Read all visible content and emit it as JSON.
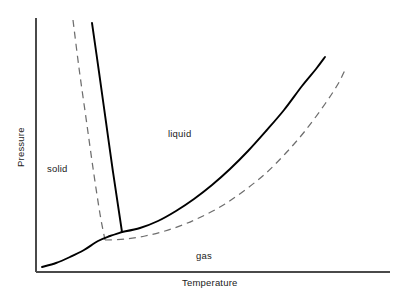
{
  "figure": {
    "background_color": "#ffffff",
    "axis_color": "#4a4a4a",
    "solid_curve_color": "#000000",
    "dashed_curve_color": "#6e6e6e"
  },
  "axes": {
    "x_title": "Temperature",
    "y_title": "Pressure"
  },
  "regions": {
    "solid_label": "solid",
    "liquid_label": "liquid",
    "gas_label": "gas"
  },
  "chart_data": {
    "type": "line",
    "title": "",
    "xlabel": "Temperature",
    "ylabel": "Pressure",
    "xlim": [
      0,
      1
    ],
    "ylim": [
      0,
      1
    ],
    "grid": false,
    "legend": "none",
    "annotations": [
      {
        "text": "solid",
        "x": 0.12,
        "y": 0.47
      },
      {
        "text": "liquid",
        "x": 0.4,
        "y": 0.57
      },
      {
        "text": "gas",
        "x": 0.47,
        "y": 0.09
      }
    ],
    "series": [
      {
        "name": "fusion-curve",
        "style": "solid",
        "color": "#000000",
        "points": [
          [
            92,
            23
          ],
          [
            99,
            72
          ],
          [
            106,
            122
          ],
          [
            113,
            172
          ],
          [
            119,
            212
          ],
          [
            122,
            232
          ]
        ]
      },
      {
        "name": "vaporization-curve",
        "style": "solid",
        "color": "#000000",
        "points": [
          [
            122,
            232
          ],
          [
            140,
            228
          ],
          [
            158,
            221
          ],
          [
            176,
            211
          ],
          [
            194,
            199
          ],
          [
            212,
            185
          ],
          [
            230,
            169
          ],
          [
            248,
            151
          ],
          [
            266,
            131
          ],
          [
            284,
            110
          ],
          [
            302,
            86
          ],
          [
            316,
            69
          ],
          [
            325,
            57
          ]
        ]
      },
      {
        "name": "sublimation-curve",
        "style": "solid",
        "color": "#000000",
        "points": [
          [
            42,
            267
          ],
          [
            56,
            263
          ],
          [
            70,
            257
          ],
          [
            84,
            250
          ],
          [
            98,
            241
          ],
          [
            110,
            236
          ],
          [
            122,
            232
          ]
        ]
      },
      {
        "name": "metastable-fusion-curve",
        "style": "dashed",
        "color": "#6e6e6e",
        "points": [
          [
            73,
            20
          ],
          [
            79,
            68
          ],
          [
            86,
            118
          ],
          [
            93,
            168
          ],
          [
            100,
            214
          ],
          [
            105,
            240
          ]
        ]
      },
      {
        "name": "metastable-vaporization-curve",
        "style": "dashed",
        "color": "#6e6e6e",
        "points": [
          [
            105,
            240
          ],
          [
            125,
            239
          ],
          [
            145,
            236
          ],
          [
            165,
            231
          ],
          [
            185,
            224
          ],
          [
            205,
            215
          ],
          [
            225,
            204
          ],
          [
            245,
            190
          ],
          [
            265,
            174
          ],
          [
            285,
            154
          ],
          [
            305,
            131
          ],
          [
            325,
            104
          ],
          [
            338,
            84
          ],
          [
            345,
            70
          ]
        ]
      }
    ]
  }
}
